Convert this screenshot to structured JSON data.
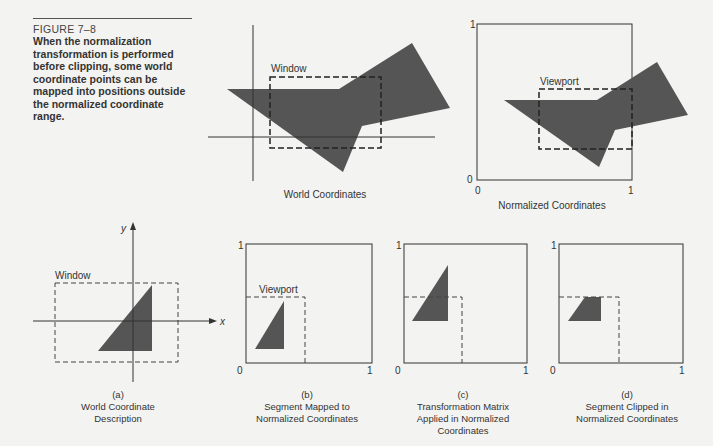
{
  "caption": {
    "figure_label": "FIGURE 7–8",
    "text": "When the normalization transformation is performed before clipping, some world coordinate points can be mapped into positions outside the normalized coordinate range."
  },
  "colors": {
    "shape_fill": "#555555",
    "line": "#333333",
    "background": "#f3f3f1"
  },
  "top_left_panel": {
    "window_label": "Window",
    "caption": "World Coordinates"
  },
  "top_right_panel": {
    "viewport_label": "Viewport",
    "caption": "Normalized Coordinates",
    "axis": {
      "y_max": "1",
      "origin": "0",
      "x_origin": "0",
      "x_max": "1"
    }
  },
  "panel_a": {
    "window_label": "Window",
    "axis_x": "x",
    "axis_y": "y",
    "tag": "(a)",
    "caption_lines": [
      "World Coordinate",
      "Description"
    ]
  },
  "panel_b": {
    "viewport_label": "Viewport",
    "axis": {
      "y_max": "1",
      "origin": "0",
      "x_max": "1"
    },
    "tag": "(b)",
    "caption_lines": [
      "Segment Mapped to",
      "Normalized Coordinates"
    ]
  },
  "panel_c": {
    "axis": {
      "y_max": "1",
      "origin": "0",
      "x_max": "1"
    },
    "tag": "(c)",
    "caption_lines": [
      "Transformation Matrix",
      "Applied in Normalized",
      "Coordinates"
    ]
  },
  "panel_d": {
    "axis": {
      "y_max": "1",
      "origin": "0",
      "x_max": "1"
    },
    "tag": "(d)",
    "caption_lines": [
      "Segment Clipped in",
      "Normalized Coordinates"
    ]
  }
}
